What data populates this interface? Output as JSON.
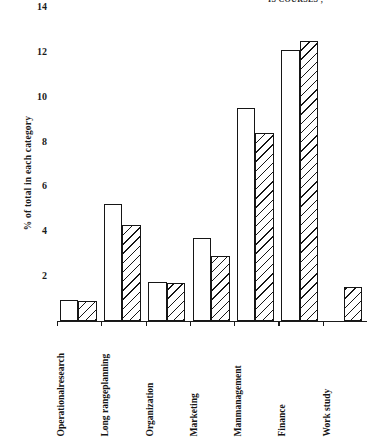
{
  "header": {
    "note": "IS COURSES ,"
  },
  "chart_data": {
    "type": "bar",
    "title": "",
    "xlabel": "",
    "ylabel": "% of total in each category",
    "ylim": [
      0,
      14
    ],
    "yticks": [
      2,
      4,
      6,
      8,
      10,
      12,
      14
    ],
    "ytick_labels": [
      "2",
      "4",
      "6",
      "8",
      "10",
      "12",
      "14"
    ],
    "grid": false,
    "legend_position": "none",
    "categories": [
      "Operational research",
      "Long range planning",
      "Organization",
      "Marketing",
      "Man management",
      "Finance",
      "Work study"
    ],
    "category_lines": [
      [
        "Operational",
        "research"
      ],
      [
        "Long range",
        "planning"
      ],
      [
        "Organization"
      ],
      [
        "Marketing"
      ],
      [
        "Man",
        "management"
      ],
      [
        "Finance"
      ],
      [
        "Work study"
      ]
    ],
    "series": [
      {
        "name": "open",
        "fill": "open",
        "values": [
          0.95,
          5.2,
          1.75,
          3.7,
          9.5,
          12.1,
          null
        ]
      },
      {
        "name": "hatched",
        "fill": "hatched",
        "values": [
          0.9,
          4.3,
          1.7,
          2.9,
          8.4,
          12.5,
          1.5
        ]
      }
    ]
  }
}
